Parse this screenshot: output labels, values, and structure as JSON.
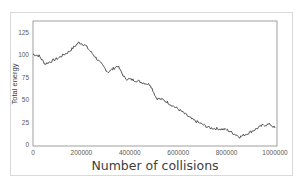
{
  "chart_data": {
    "type": "line",
    "title": "",
    "xlabel": "Number of collisions",
    "ylabel": "Total energy",
    "xlim": [
      0,
      1000000
    ],
    "ylim": [
      0,
      137
    ],
    "grid": false,
    "legend": null,
    "x_ticks": [
      0,
      200000,
      400000,
      600000,
      800000,
      1000000
    ],
    "x_tick_labels": [
      "0",
      "200000",
      "400000",
      "600000",
      "800000",
      "1000000"
    ],
    "y_ticks": [
      0,
      25,
      50,
      75,
      100,
      125
    ],
    "y_tick_labels": [
      "0",
      "25",
      "50",
      "75",
      "100",
      "125"
    ],
    "series": [
      {
        "name": "Total energy",
        "color": "#404040",
        "x": [
          0,
          25000,
          50000,
          100000,
          150000,
          190000,
          215000,
          260000,
          310000,
          350000,
          380000,
          420000,
          485000,
          510000,
          540000,
          605000,
          660000,
          730000,
          800000,
          855000,
          895000,
          950000,
          980000,
          1000000
        ],
        "y": [
          101,
          99,
          90,
          96,
          104,
          114,
          111,
          97,
          81,
          88,
          74,
          72,
          67,
          52,
          50,
          39,
          28,
          19,
          17,
          9,
          14,
          22,
          23,
          19
        ]
      }
    ]
  },
  "style": {
    "frame_border": "#d9d9d9",
    "plot_border": "#888888",
    "line_color": "#404040"
  }
}
